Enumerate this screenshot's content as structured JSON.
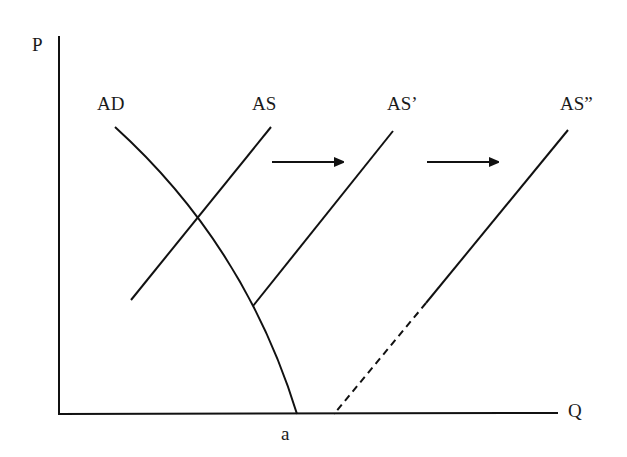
{
  "diagram": {
    "title": "",
    "type": "aggregate demand / aggregate supply shift diagram",
    "axes": {
      "y_label": "P",
      "x_label": "Q"
    },
    "curves": [
      {
        "id": "ad",
        "label": "AD",
        "shape": "concave downward-sloping curve"
      },
      {
        "id": "as",
        "label": "AS",
        "shape": "upward-sloping line"
      },
      {
        "id": "as1",
        "label": "AS’",
        "shape": "upward-sloping line"
      },
      {
        "id": "as2",
        "label": "AS”",
        "shape": "upward-sloping line, dashed extension to Q axis"
      }
    ],
    "arrows": [
      {
        "from": "AS",
        "to": "AS’",
        "direction": "right"
      },
      {
        "from": "AS’",
        "to": "AS”",
        "direction": "right"
      }
    ],
    "x_marks": [
      {
        "label": "a",
        "meaning": "AD intercept on Q axis"
      }
    ],
    "colors": {
      "line": "#111111",
      "background": "#ffffff"
    }
  }
}
